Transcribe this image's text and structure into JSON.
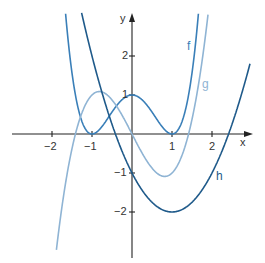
{
  "chart_data": {
    "type": "line",
    "title": "",
    "xlabel": "x",
    "ylabel": "y",
    "xlim": [
      -3,
      3
    ],
    "ylim": [
      -3,
      3
    ],
    "grid": false,
    "x_ticks": [
      "-2",
      "-1",
      "1",
      "2"
    ],
    "y_ticks": [
      "2",
      "1",
      "-1",
      "-2"
    ],
    "series": [
      {
        "name": "f",
        "formula": "(x^2-1)^2",
        "color": "#3a7fb8",
        "points": [
          [
            -1.6,
            2.43
          ],
          [
            -1.4,
            0.92
          ],
          [
            -1.2,
            0.19
          ],
          [
            -1,
            0
          ],
          [
            -0.8,
            0.13
          ],
          [
            -0.5,
            0.56
          ],
          [
            0,
            1
          ],
          [
            0.5,
            0.56
          ],
          [
            0.8,
            0.13
          ],
          [
            1,
            0
          ],
          [
            1.2,
            0.19
          ],
          [
            1.4,
            0.92
          ],
          [
            1.6,
            2.43
          ]
        ]
      },
      {
        "name": "g",
        "formula": "x^3-2x",
        "color": "#8fb4d4",
        "points": [
          [
            -1.9,
            -3.06
          ],
          [
            -1.5,
            -0.38
          ],
          [
            -1.41,
            0
          ],
          [
            -0.82,
            1.09
          ],
          [
            0,
            0
          ],
          [
            0.82,
            -1.09
          ],
          [
            1.41,
            0
          ],
          [
            1.7,
            1.51
          ],
          [
            1.9,
            3.06
          ]
        ]
      },
      {
        "name": "h",
        "formula": "x^2-2x-1",
        "color": "#1f5a8a",
        "points": [
          [
            -1.1,
            2.41
          ],
          [
            -0.41,
            0
          ],
          [
            0,
            -1
          ],
          [
            1,
            -2
          ],
          [
            2,
            -1
          ],
          [
            2.41,
            0
          ],
          [
            3,
            2
          ]
        ]
      }
    ]
  },
  "labels": {
    "x_axis": "x",
    "y_axis": "y",
    "f": "f",
    "g": "g",
    "h": "h",
    "xt_m2": "−2",
    "xt_m1": "−1",
    "xt_1": "1",
    "xt_2": "2",
    "yt_2": "2",
    "yt_1": "1",
    "yt_m1": "−1",
    "yt_m2": "−2"
  }
}
